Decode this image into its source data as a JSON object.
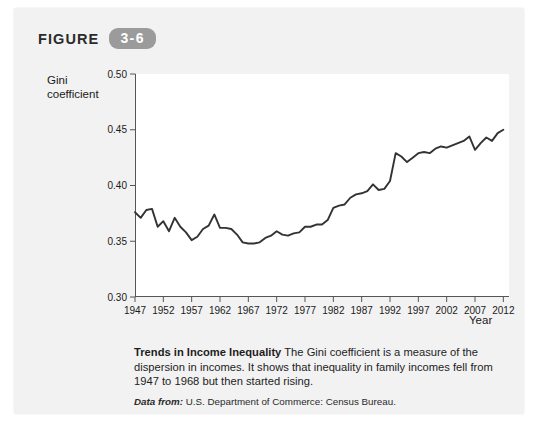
{
  "figure": {
    "label": "FIGURE",
    "number": "3-6"
  },
  "caption": {
    "title": "Trends in Income Inequality",
    "body": " The Gini coefficient is a measure of the dispersion in incomes. It shows that inequality in family incomes fell from 1947 to 1968 but then started rising.",
    "source_prefix": "Data from:",
    "source_text": " U.S. Department of Commerce: Census Bureau."
  },
  "colors": {
    "card_background": "#f2f2f2",
    "plot_background": "#ffffff",
    "badge": "#9b9b9b",
    "line": "#333333",
    "axis": "#555555",
    "text": "#1a1a1a"
  },
  "chart_data": {
    "type": "line",
    "title": "",
    "xlabel": "Year",
    "ylabel": "Gini coefficient",
    "xlim": [
      1947,
      2013
    ],
    "ylim": [
      0.3,
      0.5
    ],
    "ytick_labels": [
      "0.30",
      "0.35",
      "0.40",
      "0.45",
      "0.50"
    ],
    "yticks": [
      0.3,
      0.35,
      0.4,
      0.45,
      0.5
    ],
    "xtick_labels": [
      "1947",
      "1952",
      "1957",
      "1962",
      "1967",
      "1972",
      "1977",
      "1982",
      "1987",
      "1992",
      "1997",
      "2002",
      "2007",
      "2012"
    ],
    "xticks": [
      1947,
      1952,
      1957,
      1962,
      1967,
      1972,
      1977,
      1982,
      1987,
      1992,
      1997,
      2002,
      2007,
      2012
    ],
    "grid": false,
    "legend": "none",
    "series": [
      {
        "name": "Gini coefficient",
        "x": [
          1947,
          1948,
          1949,
          1950,
          1951,
          1952,
          1953,
          1954,
          1955,
          1956,
          1957,
          1958,
          1959,
          1960,
          1961,
          1962,
          1963,
          1964,
          1965,
          1966,
          1967,
          1968,
          1969,
          1970,
          1971,
          1972,
          1973,
          1974,
          1975,
          1976,
          1977,
          1978,
          1979,
          1980,
          1981,
          1982,
          1983,
          1984,
          1985,
          1986,
          1987,
          1988,
          1989,
          1990,
          1991,
          1992,
          1993,
          1994,
          1995,
          1996,
          1997,
          1998,
          1999,
          2000,
          2001,
          2002,
          2003,
          2004,
          2005,
          2006,
          2007,
          2008,
          2009,
          2010,
          2011,
          2012
        ],
        "values": [
          0.376,
          0.371,
          0.378,
          0.379,
          0.363,
          0.368,
          0.359,
          0.371,
          0.363,
          0.358,
          0.351,
          0.354,
          0.361,
          0.364,
          0.374,
          0.362,
          0.362,
          0.361,
          0.356,
          0.349,
          0.348,
          0.348,
          0.349,
          0.353,
          0.355,
          0.359,
          0.356,
          0.355,
          0.357,
          0.358,
          0.363,
          0.363,
          0.365,
          0.365,
          0.369,
          0.38,
          0.382,
          0.383,
          0.389,
          0.392,
          0.393,
          0.395,
          0.401,
          0.396,
          0.397,
          0.404,
          0.429,
          0.426,
          0.421,
          0.425,
          0.429,
          0.43,
          0.429,
          0.433,
          0.435,
          0.434,
          0.436,
          0.438,
          0.44,
          0.444,
          0.432,
          0.438,
          0.443,
          0.44,
          0.447,
          0.45
        ]
      }
    ]
  }
}
